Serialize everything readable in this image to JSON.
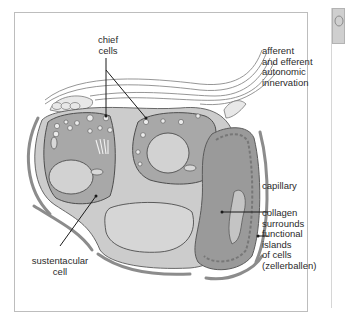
{
  "diagram": {
    "labels": {
      "chief_cells": [
        "chief",
        "cells"
      ],
      "innervation": [
        "afferent",
        "and efferent",
        "autonomic",
        "innervation"
      ],
      "capillary": "capillary",
      "collagen": [
        "collagen",
        "surrounds",
        "functional",
        "islands",
        "of cells",
        "(zellerballen)"
      ],
      "sustentacular": [
        "sustentacular",
        "cell"
      ]
    },
    "colors": {
      "cell_fill": "#a8a8a8",
      "cytoplasm_light": "#c8c8c8",
      "nucleus": "#d2d2d2",
      "capillary_fill": "#9a9a9a",
      "collagen": "#8c8c8c",
      "outline": "#555555",
      "nerve": "#e6e6e6"
    }
  },
  "side_panel": {
    "icon": "brain-thumbnail-icon"
  }
}
